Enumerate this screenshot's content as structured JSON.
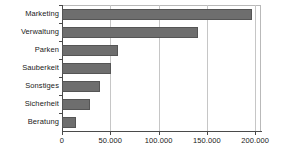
{
  "chart_data": {
    "type": "bar",
    "orientation": "horizontal",
    "title": "",
    "xlabel": "",
    "ylabel": "",
    "categories": [
      "Marketing",
      "Verwaltung",
      "Parken",
      "Sauberkeit",
      "Sonstiges",
      "Sicherheit",
      "Beratung"
    ],
    "values": [
      197000,
      141000,
      58000,
      51000,
      39000,
      29000,
      15000
    ],
    "xlim": [
      0,
      206000
    ],
    "xticks": [
      0,
      50000,
      100000,
      150000,
      200000
    ],
    "xtick_labels": [
      "0",
      "50.000",
      "100.000",
      "150.000",
      "200.000"
    ],
    "grid": "vertical",
    "legend": "none",
    "bar_color": "#6e6e6e",
    "bar_edge_color": "#555555",
    "grid_color": "#c6c6c6",
    "axis_color": "#4a4a4a",
    "plot_background": "#ffffff"
  }
}
